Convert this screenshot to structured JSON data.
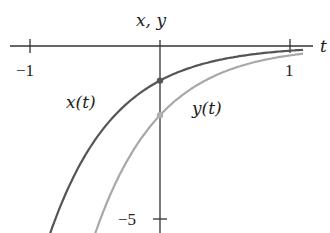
{
  "chart_data": {
    "type": "line",
    "title": "",
    "xlabel": "t",
    "ylabel": "x, y",
    "xlim": [
      -1.08,
      1.17
    ],
    "ylim": [
      -5.4,
      0.5
    ],
    "x_ticks": [
      {
        "value": -1,
        "label": "−1"
      },
      {
        "value": 1,
        "label": "1"
      }
    ],
    "y_ticks": [
      {
        "value": -5,
        "label": "−5"
      }
    ],
    "grid": false,
    "series": [
      {
        "name": "x(t)",
        "label": "x(t)",
        "color": "#555555",
        "formula": "x(t) = -e^(-2t)",
        "x": [
          -0.84,
          -0.75,
          -0.5,
          -0.25,
          0,
          0.25,
          0.5,
          0.75,
          1.0,
          1.1
        ],
        "values": [
          -5.37,
          -4.48,
          -2.72,
          -1.65,
          -1.0,
          -0.61,
          -0.37,
          -0.22,
          -0.14,
          -0.11
        ],
        "marker_at_t0": -1.0
      },
      {
        "name": "y(t)",
        "label": "y(t)",
        "color": "#aaaaaa",
        "formula": "y(t) = -2e^(-2t)",
        "x": [
          -0.5,
          -0.4,
          -0.25,
          0,
          0.25,
          0.5,
          0.75,
          1.0,
          1.1
        ],
        "values": [
          -5.44,
          -4.45,
          -3.3,
          -2.0,
          -1.21,
          -0.74,
          -0.45,
          -0.27,
          -0.22
        ],
        "marker_at_t0": -2.0
      }
    ],
    "annotations": [
      "x(t)",
      "y(t)"
    ]
  },
  "labels": {
    "axis_t": "t",
    "axis_xy": "x, y",
    "tick_neg1": "−1",
    "tick_pos1": "1",
    "tick_neg5": "−5",
    "series_x": "x(t)",
    "series_y": "y(t)"
  }
}
